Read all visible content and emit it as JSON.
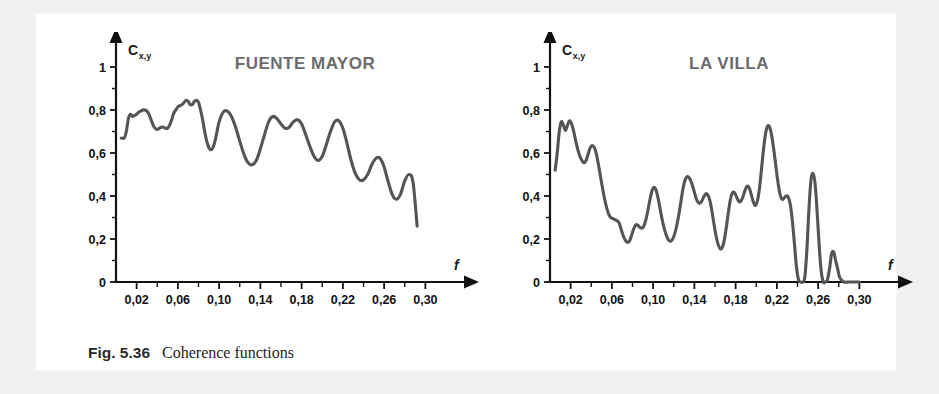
{
  "figure": {
    "caption_label": "Fig. 5.36",
    "caption_text": "Coherence functions",
    "curve_color": "#555555",
    "title_color": "#6b6b6b",
    "axis_color": "#111111",
    "background": "#ffffff",
    "page_background": "#f0f0f0"
  },
  "chart_data": [
    {
      "type": "line",
      "title": "FUENTE MAYOR",
      "xlabel": "f",
      "ylabel": "C",
      "ylabel_sub": "x,y",
      "xlim": [
        0.0,
        0.32
      ],
      "ylim": [
        0,
        1
      ],
      "grid": false,
      "legend": "none",
      "xticks": [
        0.02,
        0.06,
        0.1,
        0.14,
        0.18,
        0.22,
        0.26,
        0.3
      ],
      "xtick_labels": [
        "0,02",
        "0,06",
        "0,10",
        "0,14",
        "0,18",
        "0,22",
        "0,26",
        "0,30"
      ],
      "xminor_step": 0.02,
      "yticks": [
        0,
        0.2,
        0.4,
        0.6,
        0.8,
        1
      ],
      "ytick_labels": [
        "0",
        "0,2",
        "0,4",
        "0,6",
        "0,8",
        "1"
      ],
      "yminor_step": 0.1,
      "x": [
        0.005,
        0.008,
        0.01,
        0.012,
        0.014,
        0.016,
        0.018,
        0.02,
        0.022,
        0.024,
        0.026,
        0.028,
        0.03,
        0.032,
        0.034,
        0.036,
        0.038,
        0.04,
        0.042,
        0.044,
        0.046,
        0.048,
        0.05,
        0.052,
        0.054,
        0.056,
        0.058,
        0.06,
        0.062,
        0.064,
        0.066,
        0.068,
        0.07,
        0.072,
        0.074,
        0.076,
        0.078,
        0.08,
        0.082,
        0.084,
        0.086,
        0.088,
        0.09,
        0.092,
        0.094,
        0.096,
        0.098,
        0.1,
        0.104,
        0.108,
        0.112,
        0.116,
        0.12,
        0.124,
        0.128,
        0.132,
        0.136,
        0.14,
        0.144,
        0.148,
        0.152,
        0.156,
        0.16,
        0.164,
        0.168,
        0.172,
        0.176,
        0.18,
        0.184,
        0.188,
        0.192,
        0.196,
        0.2,
        0.204,
        0.208,
        0.212,
        0.216,
        0.22,
        0.224,
        0.228,
        0.232,
        0.236,
        0.24,
        0.244,
        0.248,
        0.252,
        0.256,
        0.26,
        0.264,
        0.268,
        0.272,
        0.276,
        0.28,
        0.284,
        0.288,
        0.292
      ],
      "y": [
        0.67,
        0.67,
        0.7,
        0.76,
        0.78,
        0.77,
        0.775,
        0.78,
        0.79,
        0.795,
        0.8,
        0.8,
        0.795,
        0.78,
        0.755,
        0.73,
        0.715,
        0.71,
        0.715,
        0.72,
        0.72,
        0.715,
        0.715,
        0.73,
        0.755,
        0.785,
        0.8,
        0.815,
        0.82,
        0.825,
        0.835,
        0.845,
        0.84,
        0.825,
        0.825,
        0.84,
        0.845,
        0.835,
        0.8,
        0.755,
        0.7,
        0.655,
        0.625,
        0.615,
        0.625,
        0.655,
        0.7,
        0.745,
        0.79,
        0.795,
        0.77,
        0.72,
        0.655,
        0.595,
        0.555,
        0.545,
        0.565,
        0.62,
        0.685,
        0.745,
        0.77,
        0.76,
        0.735,
        0.715,
        0.72,
        0.745,
        0.755,
        0.735,
        0.685,
        0.63,
        0.585,
        0.565,
        0.585,
        0.64,
        0.7,
        0.745,
        0.75,
        0.715,
        0.645,
        0.565,
        0.505,
        0.475,
        0.475,
        0.5,
        0.545,
        0.575,
        0.575,
        0.535,
        0.465,
        0.405,
        0.385,
        0.41,
        0.47,
        0.5,
        0.465,
        0.26
      ]
    },
    {
      "type": "line",
      "title": "LA VILLA",
      "xlabel": "f",
      "ylabel": "C",
      "ylabel_sub": "x,y",
      "xlim": [
        0.0,
        0.32
      ],
      "ylim": [
        0,
        1
      ],
      "grid": false,
      "legend": "none",
      "xticks": [
        0.02,
        0.06,
        0.1,
        0.14,
        0.18,
        0.22,
        0.26,
        0.3
      ],
      "xtick_labels": [
        "0,02",
        "0,06",
        "0,10",
        "0,14",
        "0,18",
        "0,22",
        "0,26",
        "0,30"
      ],
      "xminor_step": 0.02,
      "yticks": [
        0,
        0.2,
        0.4,
        0.6,
        0.8,
        1
      ],
      "ytick_labels": [
        "0",
        "0,2",
        "0,4",
        "0,6",
        "0,8",
        "1"
      ],
      "yminor_step": 0.1,
      "x": [
        0.005,
        0.007,
        0.009,
        0.011,
        0.013,
        0.015,
        0.017,
        0.019,
        0.021,
        0.023,
        0.025,
        0.027,
        0.029,
        0.031,
        0.033,
        0.035,
        0.037,
        0.039,
        0.041,
        0.043,
        0.045,
        0.047,
        0.049,
        0.051,
        0.053,
        0.055,
        0.057,
        0.059,
        0.061,
        0.063,
        0.065,
        0.067,
        0.069,
        0.071,
        0.073,
        0.075,
        0.077,
        0.079,
        0.081,
        0.083,
        0.085,
        0.087,
        0.089,
        0.091,
        0.093,
        0.095,
        0.097,
        0.099,
        0.101,
        0.103,
        0.105,
        0.107,
        0.109,
        0.111,
        0.113,
        0.115,
        0.117,
        0.119,
        0.121,
        0.123,
        0.125,
        0.127,
        0.129,
        0.131,
        0.133,
        0.135,
        0.137,
        0.139,
        0.141,
        0.143,
        0.145,
        0.147,
        0.149,
        0.151,
        0.153,
        0.155,
        0.157,
        0.159,
        0.161,
        0.163,
        0.165,
        0.167,
        0.169,
        0.171,
        0.173,
        0.175,
        0.177,
        0.179,
        0.181,
        0.183,
        0.185,
        0.187,
        0.189,
        0.191,
        0.193,
        0.195,
        0.197,
        0.199,
        0.201,
        0.203,
        0.205,
        0.207,
        0.209,
        0.211,
        0.213,
        0.215,
        0.217,
        0.219,
        0.221,
        0.223,
        0.225,
        0.227,
        0.229,
        0.231,
        0.233,
        0.235,
        0.237,
        0.239,
        0.241,
        0.243,
        0.245,
        0.247,
        0.249,
        0.251,
        0.253,
        0.255,
        0.257,
        0.259,
        0.261,
        0.263,
        0.265,
        0.267,
        0.269,
        0.271,
        0.273,
        0.275,
        0.277,
        0.279,
        0.281,
        0.285,
        0.29,
        0.295,
        0.3
      ],
      "y": [
        0.52,
        0.6,
        0.7,
        0.745,
        0.73,
        0.705,
        0.73,
        0.75,
        0.735,
        0.7,
        0.655,
        0.615,
        0.585,
        0.565,
        0.555,
        0.565,
        0.595,
        0.625,
        0.635,
        0.625,
        0.595,
        0.545,
        0.49,
        0.435,
        0.385,
        0.345,
        0.315,
        0.3,
        0.295,
        0.29,
        0.285,
        0.275,
        0.245,
        0.215,
        0.195,
        0.185,
        0.19,
        0.215,
        0.245,
        0.265,
        0.265,
        0.255,
        0.25,
        0.26,
        0.29,
        0.335,
        0.385,
        0.425,
        0.44,
        0.425,
        0.385,
        0.335,
        0.285,
        0.245,
        0.215,
        0.195,
        0.19,
        0.2,
        0.225,
        0.265,
        0.315,
        0.375,
        0.435,
        0.475,
        0.49,
        0.485,
        0.465,
        0.435,
        0.4,
        0.375,
        0.365,
        0.375,
        0.395,
        0.41,
        0.405,
        0.38,
        0.33,
        0.27,
        0.215,
        0.175,
        0.155,
        0.16,
        0.195,
        0.255,
        0.325,
        0.385,
        0.415,
        0.415,
        0.395,
        0.375,
        0.375,
        0.395,
        0.425,
        0.445,
        0.44,
        0.41,
        0.375,
        0.355,
        0.375,
        0.43,
        0.52,
        0.615,
        0.69,
        0.725,
        0.72,
        0.68,
        0.615,
        0.54,
        0.465,
        0.41,
        0.385,
        0.39,
        0.4,
        0.395,
        0.36,
        0.285,
        0.18,
        0.07,
        0.01,
        0.0,
        0.0,
        0.02,
        0.14,
        0.33,
        0.47,
        0.505,
        0.46,
        0.33,
        0.17,
        0.05,
        0.0,
        0.0,
        0.01,
        0.06,
        0.13,
        0.14,
        0.1,
        0.06,
        0.02,
        0.0,
        0.0,
        0.0,
        0.0
      ]
    }
  ]
}
